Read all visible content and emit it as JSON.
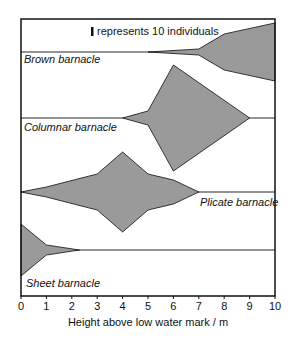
{
  "chart_data": {
    "type": "kite",
    "title": "",
    "xlabel": "Height above low water mark / m",
    "ylabel": "",
    "xlim": [
      0,
      10
    ],
    "x_ticks": [
      "0",
      "1",
      "2",
      "3",
      "4",
      "5",
      "6",
      "7",
      "8",
      "9",
      "10"
    ],
    "key": "represents 10 individuals",
    "key_bar_px": 6,
    "unit_individuals_per_bar": 10,
    "grid": false,
    "fill_color": "#9a9a9a",
    "series": [
      {
        "name": "Brown barnacle",
        "baseline_y": 52,
        "label_pos": [
          24,
          63
        ],
        "points": [
          [
            5,
            0
          ],
          [
            7,
            3
          ],
          [
            8,
            18
          ],
          [
            10,
            29
          ]
        ],
        "individuals": [
          [
            5,
            0
          ],
          [
            7,
            10
          ],
          [
            8,
            60
          ],
          [
            10,
            97
          ]
        ]
      },
      {
        "name": "Columnar barnacle",
        "baseline_y": 118,
        "label_pos": [
          24,
          131
        ],
        "points": [
          [
            4,
            0
          ],
          [
            5,
            7
          ],
          [
            6,
            53
          ],
          [
            9,
            0
          ]
        ],
        "individuals": [
          [
            4,
            0
          ],
          [
            5,
            23
          ],
          [
            6,
            177
          ],
          [
            9,
            0
          ]
        ]
      },
      {
        "name": "Plicate barnacle",
        "baseline_y": 192,
        "label_pos": [
          200,
          206
        ],
        "points": [
          [
            0,
            0
          ],
          [
            1,
            5
          ],
          [
            3,
            18
          ],
          [
            4,
            40
          ],
          [
            5,
            18
          ],
          [
            6,
            12
          ],
          [
            7,
            0
          ]
        ],
        "individuals": [
          [
            0,
            0
          ],
          [
            1,
            17
          ],
          [
            3,
            60
          ],
          [
            4,
            133
          ],
          [
            5,
            60
          ],
          [
            6,
            40
          ],
          [
            7,
            0
          ]
        ]
      },
      {
        "name": "Sheet barnacle",
        "baseline_y": 250,
        "label_pos": [
          26,
          287
        ],
        "points": [
          [
            0,
            26
          ],
          [
            1,
            5
          ],
          [
            2.3,
            0
          ]
        ],
        "individuals": [
          [
            0,
            87
          ],
          [
            1,
            17
          ],
          [
            2.3,
            0
          ]
        ]
      }
    ]
  }
}
